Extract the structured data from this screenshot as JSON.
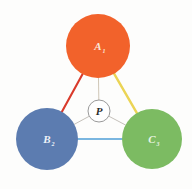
{
  "figure": {
    "type": "node-link-diagram",
    "background_color": "#fdfdfc"
  },
  "nodes": [
    {
      "id": "A",
      "label": "A",
      "subscript": "1",
      "color": "#f2622b",
      "cx": 98,
      "cy": 46,
      "r": 32,
      "label_color": "#fbe6d8"
    },
    {
      "id": "B",
      "label": "B",
      "subscript": "2",
      "color": "#5c7cb0",
      "cx": 47,
      "cy": 139,
      "r": 31,
      "label_color": "#eef2f8"
    },
    {
      "id": "C",
      "label": "C",
      "subscript": "3",
      "color": "#7cbb62",
      "cx": 152,
      "cy": 139,
      "r": 30,
      "label_color": "#eaf5e4"
    }
  ],
  "center_node": {
    "id": "P",
    "label": "P",
    "cx": 99,
    "cy": 111,
    "r": 11,
    "fill": "#ffffff",
    "stroke": "#8d8d8d",
    "label_color": "#2b2b2b"
  },
  "edges": [
    {
      "id": "A-B",
      "from": "A",
      "to": "B",
      "color": "#d93a2b",
      "width": 2.1
    },
    {
      "id": "A-C",
      "from": "A",
      "to": "C",
      "color": "#ebd455",
      "width": 2.4
    },
    {
      "id": "B-C",
      "from": "B",
      "to": "C",
      "color": "#7ab6e0",
      "width": 2.1
    }
  ],
  "spokes": [
    {
      "id": "P-A",
      "from": "P",
      "to": "A",
      "color": "#c9bfae",
      "width": 0.9
    },
    {
      "id": "P-B",
      "from": "P",
      "to": "B",
      "color": "#bdb9b2",
      "width": 0.9
    },
    {
      "id": "P-C",
      "from": "P",
      "to": "C",
      "color": "#bdb9b2",
      "width": 0.9
    }
  ]
}
